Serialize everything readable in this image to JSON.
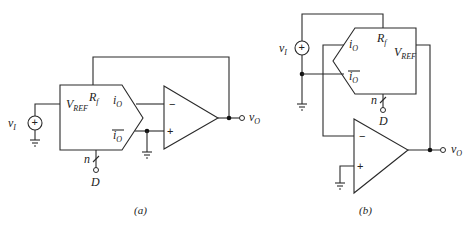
{
  "figure": {
    "panels": [
      {
        "id": "a",
        "caption": "(a)",
        "dac": {
          "vref_label": "V",
          "vref_sub": "REF",
          "rf_label": "R",
          "rf_sub": "f",
          "io_label": "i",
          "io_sub": "O",
          "iobar_label": "i",
          "iobar_sub": "O",
          "bus_label": "n",
          "digital_input_label": "D"
        },
        "source": {
          "label": "v",
          "sub": "I",
          "polarity": "+"
        },
        "opamp": {
          "inverting": "−",
          "noninverting": "+"
        },
        "output": {
          "label": "v",
          "sub": "O"
        }
      },
      {
        "id": "b",
        "caption": "(b)",
        "dac": {
          "vref_label": "V",
          "vref_sub": "REF",
          "rf_label": "R",
          "rf_sub": "f",
          "io_label": "i",
          "io_sub": "O",
          "iobar_label": "i",
          "iobar_sub": "O",
          "bus_label": "n",
          "digital_input_label": "D"
        },
        "source": {
          "label": "v",
          "sub": "I",
          "polarity": "+"
        },
        "opamp": {
          "inverting": "−",
          "noninverting": "+"
        },
        "output": {
          "label": "v",
          "sub": "O"
        }
      }
    ]
  }
}
